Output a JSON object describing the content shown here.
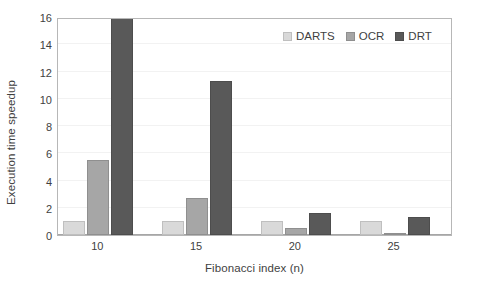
{
  "chart_data": {
    "type": "bar",
    "title": "",
    "xlabel": "Fibonacci index (n)",
    "ylabel": "Execution time speedup",
    "categories": [
      "10",
      "15",
      "20",
      "25"
    ],
    "series": [
      {
        "name": "DARTS",
        "color": "#d9d9d9",
        "values": [
          1.0,
          1.0,
          1.0,
          1.0
        ]
      },
      {
        "name": "OCR",
        "color": "#a6a6a6",
        "values": [
          5.5,
          2.7,
          0.5,
          0.15
        ]
      },
      {
        "name": "DRT",
        "color": "#595959",
        "values": [
          16.0,
          11.3,
          1.6,
          1.35
        ]
      }
    ],
    "ylim": [
      0,
      16
    ],
    "yticks": [
      0,
      2,
      4,
      6,
      8,
      10,
      12,
      14,
      16
    ],
    "ytick_labels": [
      "0",
      "2",
      "4",
      "6",
      "8",
      "10",
      "12",
      "14",
      "16"
    ],
    "grid": true,
    "grid_axis": "y",
    "legend_position": "top-right",
    "legend_orientation": "horizontal",
    "plot_border_color": "#b7b7b7",
    "gridline_color": "#f2f2f2",
    "background_color": "#ffffff",
    "text_color": "#3f3f3f"
  },
  "axes": {
    "y_title": "Execution time speedup",
    "x_title": "Fibonacci index (n)"
  },
  "legend": {
    "items": [
      {
        "label": "DARTS"
      },
      {
        "label": "OCR"
      },
      {
        "label": "DRT"
      }
    ]
  }
}
